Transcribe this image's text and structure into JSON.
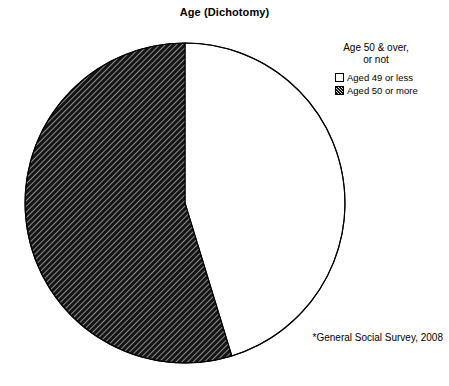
{
  "chart_data": {
    "type": "pie",
    "title": "Age (Dichotomy)",
    "legend_title": "Age 50 & over,\nor not",
    "legend_position": "top-right",
    "categories": [
      "Aged 49 or less",
      "Aged 50 or more"
    ],
    "values": [
      45.3,
      54.7
    ],
    "units": "percent",
    "start_angle_deg": 0,
    "direction": "counterclockwise",
    "slices": [
      {
        "label": "Aged 49 or less",
        "value": 45.3,
        "fill": "solid-white",
        "color": "#ffffff",
        "stroke": "#000000",
        "start_angle_deg": 197,
        "end_angle_deg": 360
      },
      {
        "label": "Aged 50 or more",
        "value": 54.7,
        "fill": "diagonal-hatch-dark",
        "color": "#141414",
        "stroke": "#000000",
        "start_angle_deg": 0,
        "end_angle_deg": 197
      }
    ],
    "annotations": [
      "*General Social Survey, 2008"
    ],
    "grid": false,
    "xlabel": "",
    "ylabel": ""
  },
  "header": {
    "title": "Age (Dichotomy)"
  },
  "legend": {
    "title": "Age 50 & over,\nor not",
    "items": [
      {
        "label": "Aged 49 or less",
        "swatch": "empty-square"
      },
      {
        "label": "Aged 50 or more",
        "swatch": "hatched-square"
      }
    ]
  },
  "footnote": {
    "text": "*General Social Survey, 2008"
  },
  "geometry": {
    "center_x": 185,
    "center_y": 203,
    "radius": 160
  },
  "colors": {
    "background": "#ffffff",
    "outline": "#000000",
    "hatch_fill": "#141414",
    "plain_fill": "#ffffff"
  }
}
